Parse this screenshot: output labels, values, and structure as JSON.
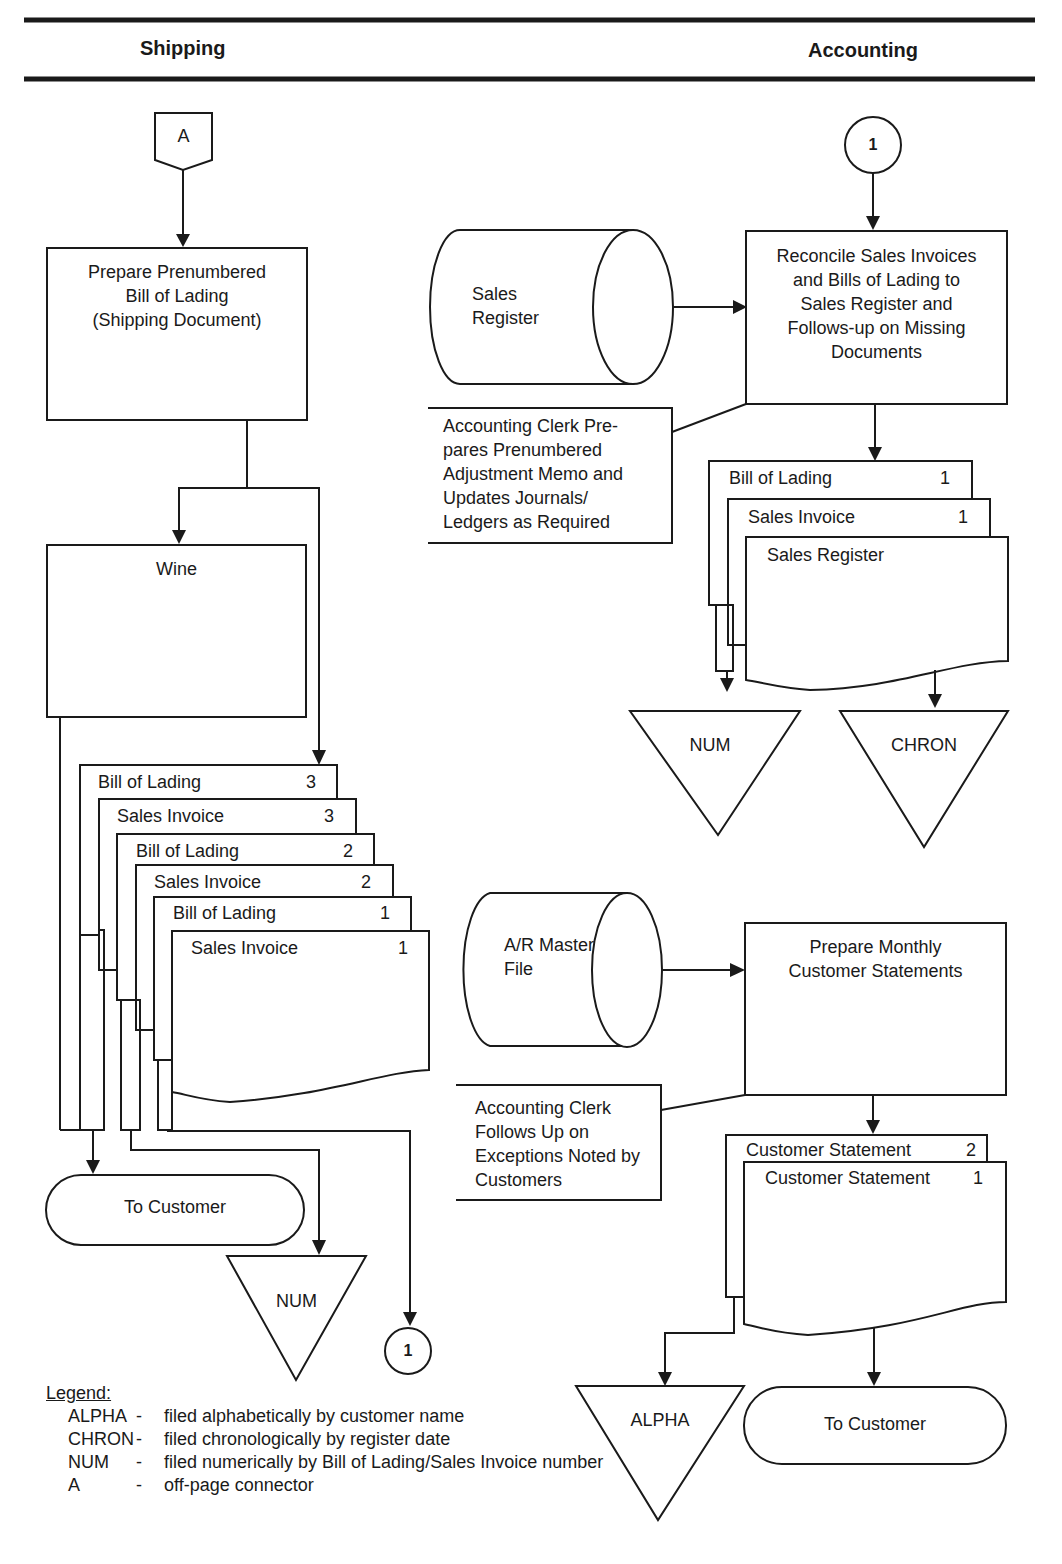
{
  "headers": {
    "left": "Shipping",
    "right": "Accounting"
  },
  "shipping": {
    "connector_a": "A",
    "process_prepare_bol": [
      "Prepare  Prenumbered",
      "Bill of Lading",
      "(Shipping Document)"
    ],
    "wine_box": "Wine",
    "document_stack": [
      {
        "title": "Bill of Lading",
        "copy": "3"
      },
      {
        "title": "Sales Invoice",
        "copy": "3"
      },
      {
        "title": "Bill of Lading",
        "copy": "2"
      },
      {
        "title": "Sales Invoice",
        "copy": "2"
      },
      {
        "title": "Bill of Lading",
        "copy": "1"
      },
      {
        "title": "Sales Invoice",
        "copy": "1"
      }
    ],
    "terminal": "To Customer",
    "file_num": "NUM",
    "connector_out": "1"
  },
  "accounting": {
    "connector_in": "1",
    "sales_register_storage": [
      "Sales",
      "Register"
    ],
    "process_reconcile": [
      "Reconcile Sales Invoices",
      "and Bills of Lading to",
      "Sales Register and",
      "Follows-up on Missing",
      "Documents"
    ],
    "annotation_adjustment": [
      "Accounting Clerk Pre-",
      "pares Prenumbered",
      "Adjustment Memo and",
      "Updates Journals/",
      "Ledgers as Required"
    ],
    "document_stack": [
      {
        "title": "Bill of Lading",
        "copy": "1"
      },
      {
        "title": "Sales Invoice",
        "copy": "1"
      },
      {
        "title": "Sales Register",
        "copy": ""
      }
    ],
    "file_num": "NUM",
    "file_chron": "CHRON",
    "ar_master_storage": [
      "A/R Master",
      "File"
    ],
    "process_statements": [
      "Prepare Monthly",
      "Customer Statements"
    ],
    "annotation_exceptions": [
      "Accounting Clerk",
      "Follows Up on",
      "Exceptions Noted by",
      "Customers"
    ],
    "statement_stack": [
      {
        "title": "Customer Statement",
        "copy": "2"
      },
      {
        "title": "Customer Statement",
        "copy": "1"
      }
    ],
    "file_alpha": "ALPHA",
    "terminal": "To Customer"
  },
  "legend": {
    "title": "Legend:",
    "items": [
      {
        "code": "ALPHA",
        "dash": "-",
        "desc": "filed alphabetically by customer name"
      },
      {
        "code": "CHRON",
        "dash": "-",
        "desc": "filed chronologically by register date"
      },
      {
        "code": "NUM",
        "dash": "-",
        "desc": "filed numerically by Bill of Lading/Sales Invoice number"
      },
      {
        "code": "A",
        "dash": "-",
        "desc": "off-page connector"
      }
    ]
  }
}
